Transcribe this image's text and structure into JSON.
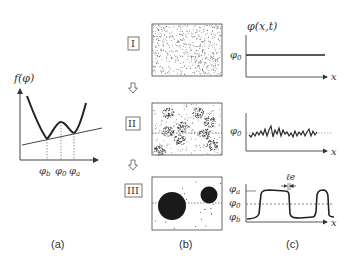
{
  "panels": {
    "a": {
      "caption": "(a)",
      "ylabel": "f(φ)",
      "ticks": [
        "φb",
        "φ0",
        "φa"
      ],
      "tick_main": [
        "φ",
        "φ",
        "φ"
      ],
      "tick_sub": [
        "b",
        "0",
        "a"
      ]
    },
    "b": {
      "caption": "(b)",
      "stages": [
        "I",
        "II",
        "III"
      ]
    },
    "c": {
      "caption": "(c)",
      "ylabel": "φ(x,t)",
      "xlabel": "x",
      "row1_level": "φ0",
      "row2_level": "φ0",
      "row3_levels": [
        "φa",
        "φ0",
        "φb"
      ],
      "interface_width": "ℓe"
    }
  }
}
